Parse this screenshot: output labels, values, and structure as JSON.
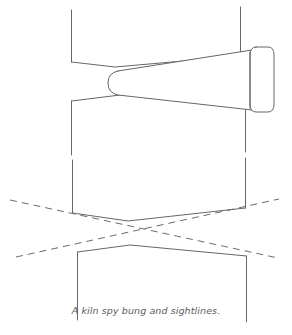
{
  "figure": {
    "caption": "A kiln spy bung and sightlines.",
    "title": "A kiln spy bung and sightlines",
    "background_color": "#ffffff",
    "line_color": "#666666",
    "dashed_line_color": "#6b6b6b",
    "caption_color": "#5a5a5a",
    "stroke_width": "1",
    "dash_pattern": "7 5",
    "parts": {
      "kiln_wall_label": "kiln wall courses",
      "bung_label": "tapered spy bung",
      "bung_flange_label": "bung flange cap",
      "sightline_upper_label": "upper sightline",
      "sightline_lower_label": "lower sightline"
    },
    "geometry": {
      "canvas_width": 292,
      "canvas_height": 335,
      "wall_left_x": 71,
      "wall_right_x": 245,
      "band_1_top_y": 10,
      "band_1_bottom_y": 62,
      "band_2_top_y": 98,
      "band_2_bottom_y": 155,
      "band_3_top_y": 160,
      "band_3_bottom_y": 215,
      "band_4_top_y": 250,
      "band_4_bottom_y": 320,
      "bung_tip_x": 109,
      "bung_flange_x": 274,
      "bung_axis_y": 83,
      "sightline_cross_x": 148,
      "sightline_cross_y": 232
    }
  }
}
